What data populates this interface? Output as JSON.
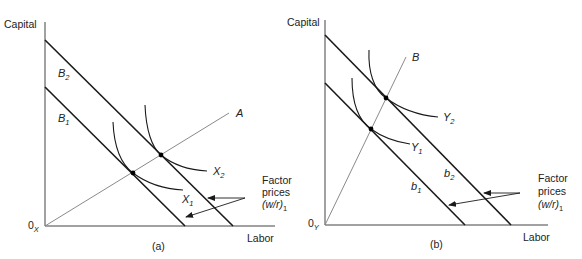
{
  "panels": [
    {
      "id": "a",
      "caption": "(a)",
      "y_axis_label": "Capital",
      "x_axis_label": "Labor",
      "origin": {
        "main": "0",
        "sub": "X"
      },
      "ray": {
        "label": "A"
      },
      "budget_lines": [
        {
          "main": "B",
          "sub": "2"
        },
        {
          "main": "B",
          "sub": "1"
        }
      ],
      "isoquants": [
        {
          "main": "X",
          "sub": "2"
        },
        {
          "main": "X",
          "sub": "1"
        }
      ],
      "annotation": {
        "line1": "Factor",
        "line2": "prices",
        "line3_main": "(w/r)",
        "line3_sub": "1"
      }
    },
    {
      "id": "b",
      "caption": "(b)",
      "y_axis_label": "Capital",
      "x_axis_label": "Labor",
      "origin": {
        "main": "0",
        "sub": "Y"
      },
      "ray": {
        "label": "B"
      },
      "budget_lines": [
        {
          "main": "b",
          "sub": "2"
        },
        {
          "main": "b",
          "sub": "1"
        }
      ],
      "isoquants": [
        {
          "main": "Y",
          "sub": "2"
        },
        {
          "main": "Y",
          "sub": "1"
        }
      ],
      "annotation": {
        "line1": "Factor",
        "line2": "prices",
        "line3_main": "(w/r)",
        "line3_sub": "1"
      }
    }
  ],
  "colors": {
    "lines": "#1a1a1a",
    "ray": "#8a8a8a",
    "text": "#222222"
  }
}
